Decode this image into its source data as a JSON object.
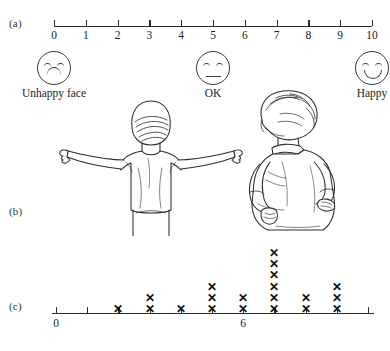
{
  "panels": {
    "a": "(a)",
    "b": "(b)",
    "c": "(c)"
  },
  "scale": {
    "min": 0,
    "max": 10,
    "ticks": [
      0,
      1,
      2,
      3,
      4,
      5,
      6,
      7,
      8,
      9,
      10
    ],
    "labels": [
      "0",
      "1",
      "2",
      "3",
      "4",
      "5",
      "6",
      "7",
      "8",
      "9",
      "10"
    ],
    "anchors": [
      {
        "value": 0,
        "caption": "Unhappy face",
        "face": "sad-face-icon"
      },
      {
        "value": 5,
        "caption": "OK",
        "face": "neutral-face-icon"
      },
      {
        "value": 10,
        "caption": "Happy",
        "face": "happy-face-icon"
      }
    ]
  },
  "figures": [
    {
      "name": "child-arms-outstretched-back-view"
    },
    {
      "name": "child-hands-on-hips-side-view"
    }
  ],
  "chart_data": {
    "type": "bar",
    "title": "",
    "xlabel": "",
    "ylabel": "",
    "xlim": [
      0,
      10
    ],
    "grid": false,
    "legend": null,
    "tick_labels": {
      "0": "0",
      "6": "6"
    },
    "ticks": [
      0,
      1,
      2,
      3,
      4,
      5,
      6,
      7,
      8,
      9,
      10
    ],
    "categories": [
      0,
      1,
      2,
      3,
      4,
      5,
      6,
      7,
      8,
      9,
      10
    ],
    "values": [
      0,
      0,
      1,
      2,
      1,
      3,
      2,
      6,
      2,
      3,
      0
    ],
    "marker": "x",
    "total_count": 20
  }
}
